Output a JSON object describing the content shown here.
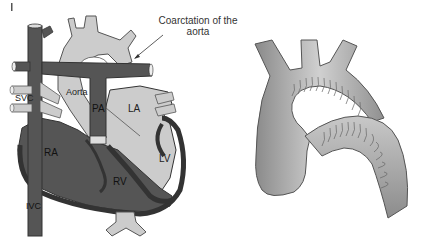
{
  "figure": {
    "panels": [
      {
        "id": "heart-diagram",
        "labels": {
          "svc": "SVC",
          "aorta": "Aorta",
          "pa": "PA",
          "la": "LA",
          "ra": "RA",
          "lv": "LV",
          "rv": "RV",
          "ivc": "IVC"
        },
        "callout": {
          "line1": "Coarctation of the",
          "line2": "aorta"
        }
      },
      {
        "id": "aortic-arch-illustration",
        "labels": {}
      }
    ],
    "colors": {
      "deoxygenated": "#555555",
      "oxygenated": "#cccccc",
      "outline": "#333333",
      "wall": "#3a3a3a",
      "background": "#ffffff"
    }
  }
}
